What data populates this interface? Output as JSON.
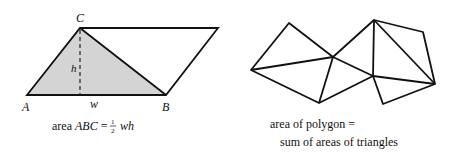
{
  "left_figure": {
    "labels": {
      "A": "A",
      "B": "B",
      "C": "C",
      "w": "w",
      "h": "h"
    },
    "caption": {
      "prefix": "area ",
      "name": "ABC",
      "equals": " = ",
      "frac_num": "1",
      "frac_den": "2",
      "expr": "wh"
    },
    "colors": {
      "triangle_fill": "#d4d4d4",
      "stroke": "#111111"
    }
  },
  "right_figure": {
    "caption_line1": "area of polygon =",
    "caption_line2": "sum of areas of triangles"
  }
}
